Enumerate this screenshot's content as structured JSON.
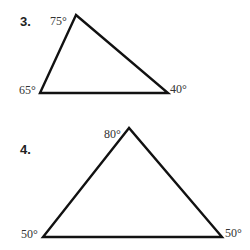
{
  "problems": [
    {
      "number": "3.",
      "angles": {
        "top": "75°",
        "bottom_left": "65°",
        "bottom_right": "40°"
      },
      "vertices": {
        "top": [
          76,
          15
        ],
        "bottom_left": [
          40,
          93
        ],
        "bottom_right": [
          168,
          93
        ]
      }
    },
    {
      "number": "4.",
      "angles": {
        "top": "80°",
        "bottom_left": "50°",
        "bottom_right": "50°"
      },
      "vertices": {
        "top": [
          129,
          128
        ],
        "bottom_left": [
          43,
          237
        ],
        "bottom_right": [
          222,
          237
        ]
      }
    }
  ]
}
